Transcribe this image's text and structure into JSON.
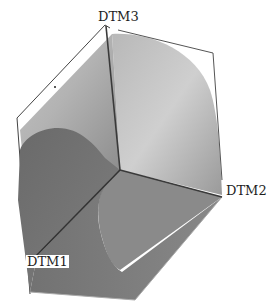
{
  "viewport": {
    "background": "#ffffff",
    "model": {
      "type": "3d-solid",
      "shading_colors": {
        "front_face_dark": "#6e6e6e",
        "front_face_mid": "#7c7c7c",
        "top_surface_light": "#c8c8c8",
        "top_surface_mid": "#a9a9a9",
        "right_face": "#8a8a8a",
        "datum_line": "#3c3c3c",
        "edge": "#555555"
      }
    },
    "datum_planes": [
      {
        "id": "dtm3",
        "label": "DTM3"
      },
      {
        "id": "dtm2",
        "label": "DTM2"
      },
      {
        "id": "dtm1",
        "label": "DTM1"
      }
    ]
  }
}
